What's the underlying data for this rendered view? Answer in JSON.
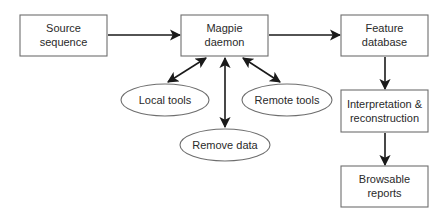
{
  "diagram": {
    "type": "flowchart",
    "nodes": [
      {
        "id": "source",
        "shape": "rect",
        "lines": [
          "Source",
          "sequence"
        ]
      },
      {
        "id": "magpie",
        "shape": "rect",
        "lines": [
          "Magpie",
          "daemon"
        ]
      },
      {
        "id": "feature",
        "shape": "rect",
        "lines": [
          "Feature",
          "database"
        ]
      },
      {
        "id": "local",
        "shape": "ellipse",
        "lines": [
          "Local tools"
        ]
      },
      {
        "id": "remote",
        "shape": "ellipse",
        "lines": [
          "Remote tools"
        ]
      },
      {
        "id": "removedata",
        "shape": "ellipse",
        "lines": [
          "Remove data"
        ]
      },
      {
        "id": "interp",
        "shape": "rect",
        "lines": [
          "Interpretation &",
          "reconstruction"
        ]
      },
      {
        "id": "reports",
        "shape": "rect",
        "lines": [
          "Browsable",
          "reports"
        ]
      }
    ],
    "edges": [
      {
        "from": "source",
        "to": "magpie",
        "direction": "forward"
      },
      {
        "from": "magpie",
        "to": "feature",
        "direction": "forward"
      },
      {
        "from": "magpie",
        "to": "local",
        "direction": "both"
      },
      {
        "from": "magpie",
        "to": "remote",
        "direction": "both"
      },
      {
        "from": "magpie",
        "to": "removedata",
        "direction": "both"
      },
      {
        "from": "feature",
        "to": "interp",
        "direction": "forward"
      },
      {
        "from": "interp",
        "to": "reports",
        "direction": "forward"
      }
    ]
  },
  "colors": {
    "box_stroke": "#6e6e6e",
    "arrow": "#1a1a1a",
    "text": "#2a2a2a",
    "background": "#ffffff"
  }
}
